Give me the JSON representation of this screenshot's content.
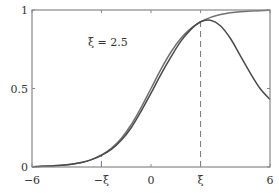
{
  "chart_data": {
    "type": "line",
    "title": "",
    "xlabel": "",
    "ylabel": "",
    "xlim": [
      -6,
      6
    ],
    "ylim": [
      0,
      1
    ],
    "grid": false,
    "legend": null,
    "x_ticks": [
      {
        "value": -6,
        "label": "−6"
      },
      {
        "value": -2.5,
        "label": "−ξ"
      },
      {
        "value": 0,
        "label": "0"
      },
      {
        "value": 2.5,
        "label": "ξ"
      },
      {
        "value": 6,
        "label": "6"
      }
    ],
    "y_ticks": [
      {
        "value": 0,
        "label": "0"
      },
      {
        "value": 0.5,
        "label": "0.5"
      },
      {
        "value": 1,
        "label": "1"
      }
    ],
    "annotations": [
      {
        "text": "ξ = 2.5",
        "x": -2.1,
        "y": 0.78
      },
      {
        "type": "vline-dashed",
        "x": 2.5,
        "from": 0,
        "to": 0.935
      },
      {
        "type": "vline-dashed",
        "x": -2.5,
        "from": 0,
        "to": 0.075
      }
    ],
    "x": [
      -6,
      -5.5,
      -5,
      -4.5,
      -4,
      -3.5,
      -3,
      -2.5,
      -2,
      -1.5,
      -1,
      -0.5,
      0,
      0.5,
      1,
      1.5,
      2,
      2.5,
      3,
      3.5,
      4,
      4.5,
      5,
      5.5,
      6
    ],
    "series": [
      {
        "name": "sigmoid",
        "values": [
          0.002,
          0.004,
          0.007,
          0.011,
          0.018,
          0.029,
          0.047,
          0.076,
          0.119,
          0.182,
          0.269,
          0.378,
          0.5,
          0.622,
          0.731,
          0.818,
          0.881,
          0.924,
          0.953,
          0.971,
          0.982,
          0.989,
          0.993,
          0.996,
          0.998
        ]
      },
      {
        "name": "bump",
        "values": [
          0.002,
          0.004,
          0.007,
          0.011,
          0.018,
          0.029,
          0.047,
          0.075,
          0.112,
          0.17,
          0.25,
          0.355,
          0.47,
          0.59,
          0.7,
          0.8,
          0.875,
          0.925,
          0.935,
          0.9,
          0.82,
          0.71,
          0.6,
          0.5,
          0.43
        ]
      }
    ]
  },
  "labels": {
    "annotation": "ξ = 2.5",
    "x_ticks": [
      "−6",
      "−ξ",
      "0",
      "ξ",
      "6"
    ],
    "y_ticks": [
      "0",
      "0.5",
      "1"
    ]
  }
}
